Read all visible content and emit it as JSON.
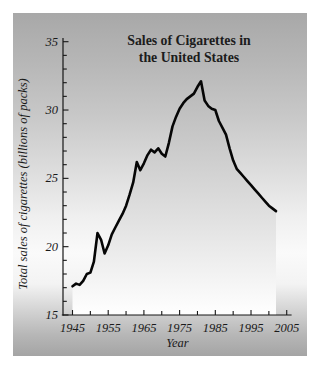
{
  "page": {
    "background_color": "#ffffff",
    "panel": {
      "gradient_top": "#a8a8a8",
      "gradient_middle": "#fafafa",
      "gradient_bottom": "#a4a4a4"
    }
  },
  "chart_data": {
    "type": "area",
    "title": "Sales of Cigarettes in the United States",
    "title_lines": [
      "Sales of Cigarettes in",
      "the United States"
    ],
    "xlabel": "Year",
    "ylabel": "Total sales of cigarettes (billions of packs)",
    "xlim": [
      1942.3,
      2006.2
    ],
    "ylim": [
      15,
      35
    ],
    "x_major_ticks": [
      1945,
      1955,
      1965,
      1975,
      1985,
      1995,
      2005
    ],
    "x_minor_ticks": [
      1950,
      1960,
      1970,
      1980,
      1990,
      2000
    ],
    "y_major_ticks": [
      15,
      20,
      25,
      30,
      35
    ],
    "y_minor_ticks": [
      16,
      17,
      18,
      19,
      21,
      22,
      23,
      24,
      26,
      27,
      28,
      29,
      31,
      32,
      33,
      34
    ],
    "grid": false,
    "legend": false,
    "line_color": "#060606",
    "area_fill_top": "#b6b6b6",
    "area_fill_bottom": "#fefefe",
    "series": [
      {
        "name": "Total sales of cigarettes (billions of packs)",
        "points": [
          [
            1945,
            17.1
          ],
          [
            1946,
            17.3
          ],
          [
            1947,
            17.2
          ],
          [
            1948,
            17.5
          ],
          [
            1949,
            18.0
          ],
          [
            1950,
            18.1
          ],
          [
            1951,
            18.9
          ],
          [
            1952,
            21.0
          ],
          [
            1953,
            20.5
          ],
          [
            1954,
            19.5
          ],
          [
            1955,
            20.1
          ],
          [
            1956,
            20.9
          ],
          [
            1957,
            21.4
          ],
          [
            1958,
            21.9
          ],
          [
            1959,
            22.4
          ],
          [
            1960,
            23.0
          ],
          [
            1961,
            23.8
          ],
          [
            1962,
            24.7
          ],
          [
            1963,
            26.2
          ],
          [
            1964,
            25.6
          ],
          [
            1965,
            26.1
          ],
          [
            1966,
            26.7
          ],
          [
            1967,
            27.1
          ],
          [
            1968,
            26.9
          ],
          [
            1969,
            27.2
          ],
          [
            1970,
            26.8
          ],
          [
            1971,
            26.6
          ],
          [
            1972,
            27.6
          ],
          [
            1973,
            28.8
          ],
          [
            1974,
            29.5
          ],
          [
            1975,
            30.1
          ],
          [
            1976,
            30.5
          ],
          [
            1977,
            30.8
          ],
          [
            1978,
            31.0
          ],
          [
            1979,
            31.2
          ],
          [
            1980,
            31.7
          ],
          [
            1981,
            32.1
          ],
          [
            1982,
            30.7
          ],
          [
            1983,
            30.3
          ],
          [
            1984,
            30.1
          ],
          [
            1985,
            30.0
          ],
          [
            1986,
            29.2
          ],
          [
            1987,
            28.7
          ],
          [
            1988,
            28.2
          ],
          [
            1989,
            27.2
          ],
          [
            1990,
            26.3
          ],
          [
            1991,
            25.7
          ],
          [
            1992,
            25.4
          ],
          [
            1993,
            25.1
          ],
          [
            1994,
            24.8
          ],
          [
            1995,
            24.5
          ],
          [
            1996,
            24.2
          ],
          [
            1997,
            23.9
          ],
          [
            1998,
            23.6
          ],
          [
            1999,
            23.3
          ],
          [
            2000,
            23.0
          ],
          [
            2001,
            22.8
          ],
          [
            2002,
            22.6
          ]
        ]
      }
    ]
  }
}
